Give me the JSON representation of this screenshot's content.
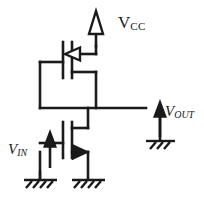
{
  "diagram": {
    "background": "#ffffff",
    "stroke": "#1a1a1a",
    "labels": {
      "vcc": {
        "base": "V",
        "sub": "CC"
      },
      "vin": {
        "base": "V",
        "sub": "IN"
      },
      "vout": {
        "base": "V",
        "sub": "OUT"
      }
    },
    "components": [
      {
        "name": "pmos-transistor",
        "type": "mosfet",
        "channel": "p",
        "arrow": "hollow-inward"
      },
      {
        "name": "nmos-transistor",
        "type": "mosfet",
        "channel": "n",
        "arrow": "filled-outward"
      },
      {
        "name": "vcc-supply-arrow",
        "type": "arrow",
        "fill": "hollow",
        "direction": "up"
      },
      {
        "name": "vin-source-arrow",
        "type": "arrow",
        "fill": "solid",
        "direction": "up"
      },
      {
        "name": "vout-probe-arrow",
        "type": "arrow",
        "fill": "solid",
        "direction": "up"
      },
      {
        "name": "ground-vin",
        "type": "ground",
        "hatches": 4
      },
      {
        "name": "ground-nmos-source",
        "type": "ground",
        "hatches": 4
      },
      {
        "name": "ground-vout",
        "type": "ground",
        "hatches": 3
      }
    ]
  }
}
